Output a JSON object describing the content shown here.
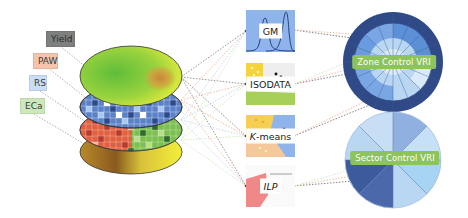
{
  "inputs": {
    "layers": [
      {
        "id": "yield",
        "label": "Yield",
        "color": "#7f7f7f",
        "text_color": "#2a2a2a"
      },
      {
        "id": "paw",
        "label": "PAW",
        "color": "#f6c4aa",
        "text_color": "#3a3a3a"
      },
      {
        "id": "rs",
        "label": "RS",
        "color": "#c9def6",
        "text_color": "#3a3a3a"
      },
      {
        "id": "eca",
        "label": "ECa",
        "color": "#cde9bc",
        "text_color": "#3a3a3a"
      }
    ]
  },
  "methods": [
    {
      "id": "gm",
      "label": "GM"
    },
    {
      "id": "isodata",
      "label": "ISODATA"
    },
    {
      "id": "kmeans",
      "label_italic": "K",
      "label_rest": "-means"
    },
    {
      "id": "ilp",
      "label": "ILP"
    }
  ],
  "outputs": [
    {
      "id": "zone",
      "label": "Zone Control VRI"
    },
    {
      "id": "sector",
      "label": "Sector Control VRI"
    }
  ],
  "colors": {
    "tag_green": "#8cc35a",
    "ring_dark": "#2f4a86",
    "blue_mid": "#7aa7e4",
    "blue_light": "#b9d6f3",
    "blue_pale": "#dbeafa"
  }
}
